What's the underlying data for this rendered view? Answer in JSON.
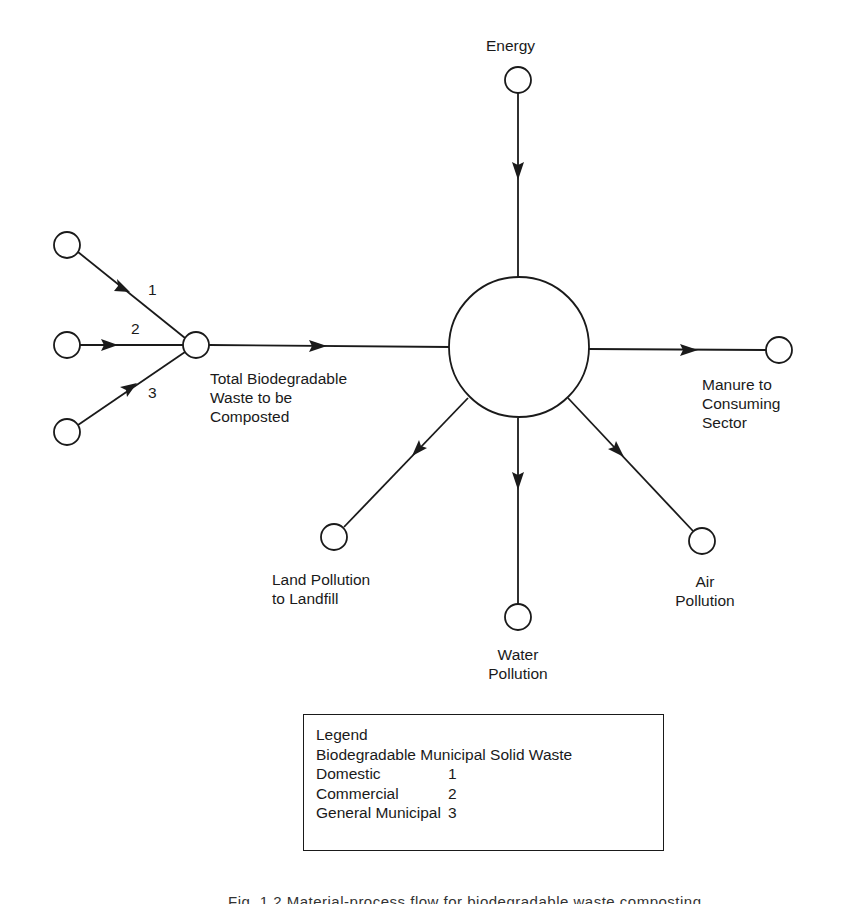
{
  "diagram": {
    "nodes": {
      "energy": {
        "label": "Energy"
      },
      "source_1": {
        "label": ""
      },
      "source_2": {
        "label": ""
      },
      "source_3": {
        "label": ""
      },
      "junction": {
        "label_lines": [
          "Total Biodegradable",
          "Waste to be",
          "Composted"
        ]
      },
      "process": {
        "label": ""
      },
      "manure": {
        "label_lines": [
          "Manure to",
          "Consuming",
          "Sector"
        ]
      },
      "land": {
        "label_lines": [
          "Land Pollution",
          "to Landfill"
        ]
      },
      "water": {
        "label_lines": [
          "Water",
          "Pollution"
        ]
      },
      "air": {
        "label_lines": [
          "Air",
          "Pollution"
        ]
      }
    },
    "edges": [
      {
        "from": "source_1",
        "to": "junction",
        "label": "1"
      },
      {
        "from": "source_2",
        "to": "junction",
        "label": "2"
      },
      {
        "from": "source_3",
        "to": "junction",
        "label": "3"
      },
      {
        "from": "junction",
        "to": "process",
        "label": ""
      },
      {
        "from": "energy",
        "to": "process",
        "label": ""
      },
      {
        "from": "process",
        "to": "manure",
        "label": ""
      },
      {
        "from": "process",
        "to": "land",
        "label": ""
      },
      {
        "from": "process",
        "to": "water",
        "label": ""
      },
      {
        "from": "process",
        "to": "air",
        "label": ""
      }
    ]
  },
  "legend": {
    "title": "Legend",
    "subtitle": "Biodegradable Municipal Solid Waste",
    "items": [
      {
        "name": "Domestic",
        "code": "1"
      },
      {
        "name": "Commercial",
        "code": "2"
      },
      {
        "name": "General Municipal",
        "code": "3"
      }
    ]
  },
  "caption": "Fig. 1.2  Material-process flow for biodegradable waste composting"
}
